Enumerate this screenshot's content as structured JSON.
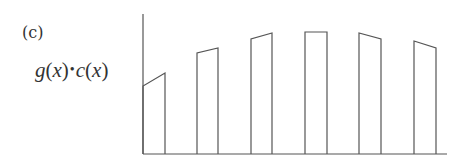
{
  "panel_label": "(c)",
  "ylabel": {
    "g": "g",
    "open1": "(",
    "x1": "x",
    "close1": ")",
    "dot": "•",
    "c": "c",
    "open2": "(",
    "x2": "x",
    "close2": ")"
  },
  "colors": {
    "stroke": "#555555",
    "text": "#333333"
  },
  "chart_data": {
    "type": "bar",
    "title": "(c)",
    "ylabel": "g(x)·c(x)",
    "xlabel": "",
    "grid": false,
    "axis": {
      "origin_px": [
        143,
        154
      ],
      "y_top_px": 14,
      "x_end_px": 447
    },
    "note": "Six separated trapezoidal bars; each bar top is a straight segment (left height -> right height). Heights in pixels above baseline (baseline y=154).",
    "bars": [
      {
        "x0": 143,
        "x1": 165,
        "h_left": 68,
        "h_right": 81
      },
      {
        "x0": 197,
        "x1": 218,
        "h_left": 101,
        "h_right": 106
      },
      {
        "x0": 251,
        "x1": 272,
        "h_left": 115,
        "h_right": 121
      },
      {
        "x0": 305,
        "x1": 327,
        "h_left": 122,
        "h_right": 122
      },
      {
        "x0": 359,
        "x1": 381,
        "h_left": 121,
        "h_right": 115
      },
      {
        "x0": 414,
        "x1": 436,
        "h_left": 113,
        "h_right": 106
      }
    ]
  }
}
